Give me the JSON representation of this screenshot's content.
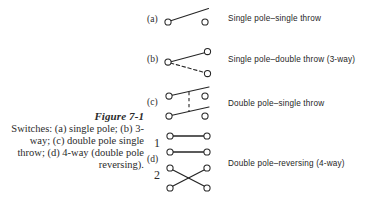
{
  "figure": {
    "number": "Figure 7-1",
    "caption": "Switches: (a) single pole; (b) 3-way; (c) double pole single throw; (d) 4-way (double pole reversing)."
  },
  "items": [
    {
      "key": "a",
      "label": "(a)",
      "description": "Single pole–single throw"
    },
    {
      "key": "b",
      "label": "(b)",
      "description": "Single pole–double throw (3-way)"
    },
    {
      "key": "c",
      "label": "(c)",
      "description": "Double pole–single throw"
    },
    {
      "key": "d",
      "label": "(d)",
      "description": "Double pole–reversing (4-way)"
    }
  ],
  "pole_numbers": {
    "one": "1",
    "two": "2"
  },
  "colors": {
    "background": "#ffffff",
    "ink": "#1a1a1a",
    "caption_ink": "#2b2b2b",
    "terminal_stroke": "#262626",
    "terminal_fill": "#ffffff"
  },
  "diagram_geometry": {
    "a": {
      "terminals": [
        {
          "x": 168,
          "y": 22
        },
        {
          "x": 205,
          "y": 22
        }
      ],
      "solid_arms": [
        {
          "x1": 170,
          "y1": 21,
          "x2": 208,
          "y2": 9
        }
      ],
      "dashed_arms": []
    },
    "b": {
      "terminals": [
        {
          "x": 168,
          "y": 62
        },
        {
          "x": 207,
          "y": 52
        },
        {
          "x": 207,
          "y": 73
        }
      ],
      "solid_arms": [
        {
          "x1": 170,
          "y1": 62,
          "x2": 205,
          "y2": 53
        }
      ],
      "dashed_arms": [
        {
          "x1": 170,
          "y1": 63,
          "x2": 204,
          "y2": 73
        }
      ]
    },
    "c": {
      "terminals": [
        {
          "x": 169,
          "y": 96
        },
        {
          "x": 205,
          "y": 96
        },
        {
          "x": 169,
          "y": 116
        },
        {
          "x": 205,
          "y": 116
        }
      ],
      "solid_arms": [
        {
          "x1": 171,
          "y1": 96,
          "x2": 208,
          "y2": 88
        },
        {
          "x1": 171,
          "y1": 116,
          "x2": 208,
          "y2": 108
        }
      ],
      "dashed_arms": [
        {
          "x1": 189,
          "y1": 93,
          "x2": 189,
          "y2": 113
        }
      ]
    },
    "d": {
      "section_1": {
        "terminals": [
          {
            "x": 170,
            "y": 136
          },
          {
            "x": 207,
            "y": 136
          },
          {
            "x": 170,
            "y": 152
          },
          {
            "x": 207,
            "y": 152
          }
        ],
        "solid_arms": [
          {
            "x1": 172,
            "y1": 136,
            "x2": 205,
            "y2": 136
          },
          {
            "x1": 172,
            "y1": 152,
            "x2": 205,
            "y2": 152
          }
        ]
      },
      "section_2": {
        "terminals": [
          {
            "x": 170,
            "y": 168
          },
          {
            "x": 207,
            "y": 168
          },
          {
            "x": 170,
            "y": 188
          },
          {
            "x": 207,
            "y": 188
          }
        ],
        "solid_arms": [
          {
            "x1": 172,
            "y1": 169,
            "x2": 205,
            "y2": 187
          },
          {
            "x1": 172,
            "y1": 187,
            "x2": 205,
            "y2": 169
          }
        ]
      }
    }
  }
}
